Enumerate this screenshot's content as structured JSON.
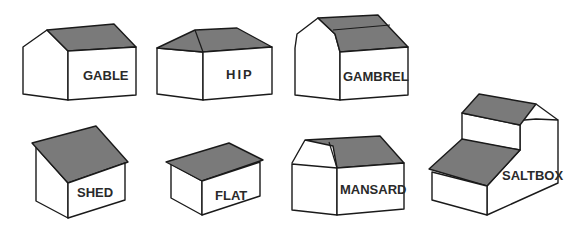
{
  "colors": {
    "roof": "#7a7a7a",
    "wall": "#ffffff",
    "outline": "#1a1a1a",
    "label": "#2a2a2a"
  },
  "roofs": [
    {
      "id": "gable",
      "label": "GABLE"
    },
    {
      "id": "hip",
      "label": "HIP"
    },
    {
      "id": "gambrel",
      "label": "GAMBREL"
    },
    {
      "id": "shed",
      "label": "SHED"
    },
    {
      "id": "flat",
      "label": "FLAT"
    },
    {
      "id": "mansard",
      "label": "MANSARD"
    },
    {
      "id": "saltbox",
      "label": "SALTBOX"
    }
  ]
}
